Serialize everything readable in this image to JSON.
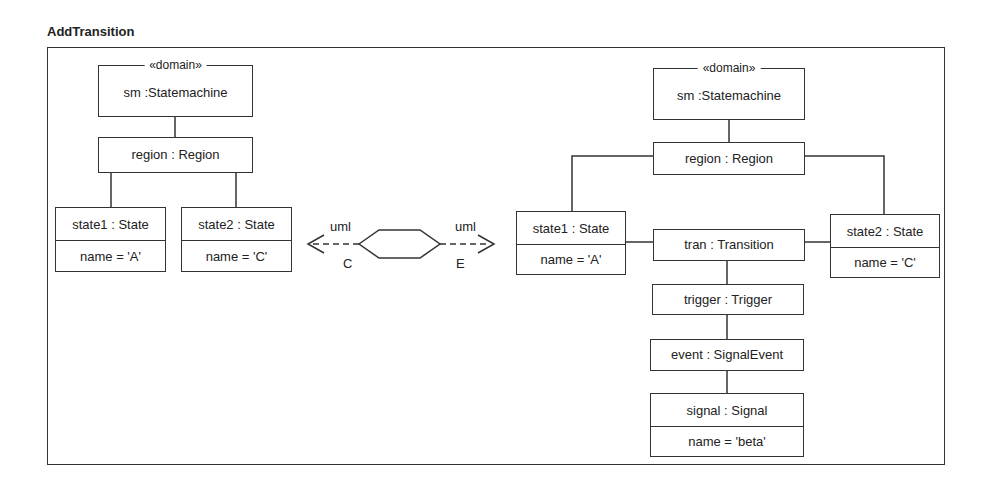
{
  "diagram": {
    "title": "AddTransition",
    "left": {
      "statemachine": {
        "stereotype": "«domain»",
        "label": "sm :Statemachine"
      },
      "region": {
        "label": "region : Region"
      },
      "state1": {
        "label": "state1 : State",
        "attr": "name = 'A'"
      },
      "state2": {
        "label": "state2 : State",
        "attr": "name = 'C'"
      }
    },
    "relation": {
      "left_end": {
        "model": "uml",
        "mode": "C"
      },
      "right_end": {
        "model": "uml",
        "mode": "E"
      }
    },
    "right": {
      "statemachine": {
        "stereotype": "«domain»",
        "label": "sm :Statemachine"
      },
      "region": {
        "label": "region : Region"
      },
      "state1": {
        "label": "state1 : State",
        "attr": "name = 'A'"
      },
      "state2": {
        "label": "state2 : State",
        "attr": "name = 'C'"
      },
      "transition": {
        "label": "tran : Transition"
      },
      "trigger": {
        "label": "trigger : Trigger"
      },
      "event": {
        "label": "event : SignalEvent"
      },
      "signal": {
        "label": "signal : Signal",
        "attr": "name = 'beta'"
      }
    }
  }
}
